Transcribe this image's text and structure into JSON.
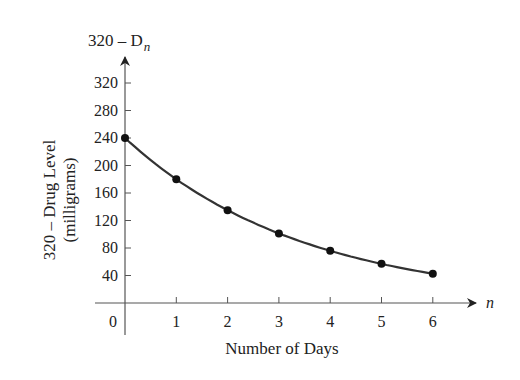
{
  "chart_data": {
    "type": "line",
    "title": "",
    "xlabel": "Number of Days",
    "ylabel": "320 – Drug Level",
    "ylabel_units": "(milligrams)",
    "y_axis_name": "320 – D",
    "y_axis_subscript": "n",
    "x_axis_name": "n",
    "x": [
      0,
      1,
      2,
      3,
      4,
      5,
      6
    ],
    "values": [
      240,
      180,
      135,
      101.25,
      75.94,
      56.95,
      42.71
    ],
    "series": [
      {
        "name": "320 – D_n",
        "values": [
          240,
          180,
          135,
          101.25,
          75.94,
          56.95,
          42.71
        ]
      }
    ],
    "x_ticks": [
      "0",
      "1",
      "2",
      "3",
      "4",
      "5",
      "6"
    ],
    "y_ticks": [
      "40",
      "80",
      "120",
      "160",
      "200",
      "240",
      "280",
      "320"
    ],
    "xlim": [
      0,
      6.8
    ],
    "ylim": [
      0,
      350
    ],
    "grid": false,
    "legend": "none",
    "markers": true,
    "line_color": "#333333",
    "marker_color": "#111111"
  }
}
